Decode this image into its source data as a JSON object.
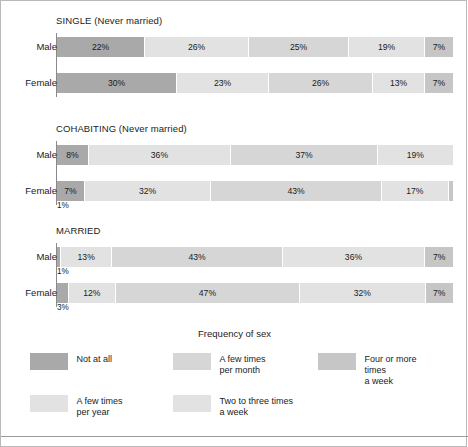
{
  "figure": {
    "legend_title": "Frequency of sex"
  },
  "chart_data": {
    "type": "bar",
    "orientation": "horizontal",
    "stacked": true,
    "normalized": true,
    "title": "",
    "xlabel": "",
    "ylabel": "",
    "xlim": [
      0,
      100
    ],
    "grid": false,
    "legend_position": "bottom",
    "legend_title": "Frequency of sex",
    "series": [
      {
        "name": "Not at all",
        "color": "#a9a9a9"
      },
      {
        "name": "A few times per year",
        "color": "#e2e2e2"
      },
      {
        "name": "A few times per month",
        "color": "#d6d6d6"
      },
      {
        "name": "Two to three times a week",
        "color": "#e2e2e2"
      },
      {
        "name": "Four or more times a week",
        "color": "#c6c6c6"
      }
    ],
    "panels": [
      {
        "title": "SINGLE (Never married)",
        "rows": [
          {
            "label": "Male",
            "values": [
              22,
              26,
              25,
              19,
              7
            ],
            "labels": [
              "22%",
              "26%",
              "25%",
              "19%",
              "7%"
            ],
            "footnote": ""
          },
          {
            "label": "Female",
            "values": [
              30,
              23,
              26,
              13,
              7
            ],
            "labels": [
              "30%",
              "23%",
              "26%",
              "13%",
              "7%"
            ],
            "footnote": ""
          }
        ]
      },
      {
        "title": "COHABITING (Never married)",
        "rows": [
          {
            "label": "Male",
            "values": [
              8,
              36,
              37,
              19,
              0
            ],
            "labels": [
              "8%",
              "36%",
              "37%",
              "19%",
              ""
            ],
            "footnote": ""
          },
          {
            "label": "Female",
            "values": [
              7,
              32,
              43,
              17,
              1
            ],
            "labels": [
              "7%",
              "32%",
              "43%",
              "17%",
              ""
            ],
            "footnote": "1%"
          }
        ]
      },
      {
        "title": "MARRIED",
        "rows": [
          {
            "label": "Male",
            "values": [
              1,
              13,
              43,
              36,
              7
            ],
            "labels": [
              "",
              "13%",
              "43%",
              "36%",
              "7%"
            ],
            "footnote": "1%"
          },
          {
            "label": "Female",
            "values": [
              3,
              12,
              47,
              32,
              7
            ],
            "labels": [
              "",
              "12%",
              "47%",
              "32%",
              "7%"
            ],
            "footnote": "3%"
          }
        ]
      }
    ],
    "legend_entries": [
      {
        "label": "Not at all",
        "color": "#a9a9a9"
      },
      {
        "label": "A few times\nper month",
        "color": "#d6d6d6"
      },
      {
        "label": "Four or more times\na week",
        "color": "#c6c6c6"
      },
      {
        "label": "A few times\nper year",
        "color": "#e2e2e2"
      },
      {
        "label": "Two to three times\na week",
        "color": "#e2e2e2"
      }
    ]
  }
}
